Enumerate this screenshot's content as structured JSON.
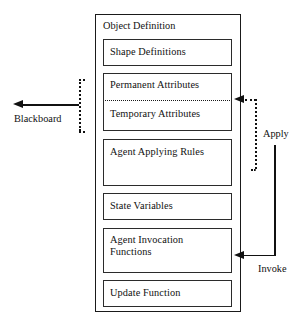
{
  "diagram": {
    "title": "Object Definition",
    "container": {
      "label": "Object Definition"
    },
    "components": [
      {
        "id": "shape-definitions",
        "label": "Shape Definitions"
      },
      {
        "id": "permanent-attributes",
        "label": "Permanent Attributes"
      },
      {
        "id": "temporary-attributes",
        "label": "Temporary Attributes"
      },
      {
        "id": "agent-applying-rules",
        "label": "Agent Applying Rules"
      },
      {
        "id": "state-variables",
        "label": "State Variables"
      },
      {
        "id": "agent-invocation-functions",
        "label": "Agent Invocation\nFunctions"
      },
      {
        "id": "update-function",
        "label": "Update Function"
      }
    ],
    "connectors": [
      {
        "id": "blackboard",
        "label": "Blackboard",
        "style": "solid",
        "direction": "left",
        "from": "permanent-temporary-attributes",
        "to": "external-blackboard"
      },
      {
        "id": "apply",
        "label": "Apply",
        "style": "dotted",
        "direction": "left",
        "from": "agent-applying-rules",
        "to": "permanent-temporary-attributes"
      },
      {
        "id": "invoke",
        "label": "Invoke",
        "style": "solid",
        "direction": "left",
        "from": "external-invoke",
        "to": "agent-invocation-functions"
      }
    ],
    "colors": {
      "stroke": "#111111",
      "background": "#ffffff",
      "text": "#111111"
    }
  }
}
